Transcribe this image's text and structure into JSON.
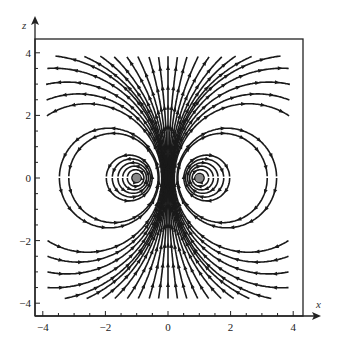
{
  "chart_data": {
    "type": "streamline",
    "title": "",
    "xlabel": "x",
    "ylabel": "z",
    "xlim": [
      -4.3,
      4.3
    ],
    "ylim": [
      -4.3,
      4.3
    ],
    "x_ticks": [
      -4,
      -2,
      0,
      2,
      4
    ],
    "y_ticks": [
      -4,
      -2,
      0,
      2,
      4
    ],
    "x_tick_labels": [
      "−4",
      "−2",
      "0",
      "2",
      "4"
    ],
    "y_tick_labels": [
      "−4",
      "−2",
      "0",
      "2",
      "4"
    ],
    "grid": false,
    "sources": [
      {
        "x": -1,
        "z": 0,
        "marker": "gray-dot",
        "circulation": "counterclockwise"
      },
      {
        "x": 1,
        "z": 0,
        "marker": "gray-dot",
        "circulation": "clockwise"
      }
    ],
    "field_description": "Magnetic field lines of a current loop cross-section; lines circulate around points at x=±1, z=0 and point upward (+z) along x=0",
    "line_color": "#1a1a1a",
    "marker_color": "#888888"
  }
}
